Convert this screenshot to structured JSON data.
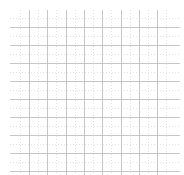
{
  "figure": {
    "title": "",
    "background_color": "#ffffff",
    "width": 184,
    "height": 175
  },
  "chart_data": {
    "type": "table",
    "title": "",
    "subtitle": "",
    "xlabel": "",
    "ylabel": "",
    "grid": true,
    "legend": "none",
    "categories": [],
    "values": [],
    "series": [],
    "xlim": [
      0,
      184
    ],
    "ylim": [
      0,
      175
    ],
    "major_grid": {
      "color": "#bdbdbd",
      "line_width": 1,
      "style": "solid",
      "horizontal_positions": [
        27,
        45,
        63,
        81,
        99,
        117,
        135,
        153,
        171
      ],
      "vertical_positions": [
        29,
        47.3,
        65.6,
        83.9,
        102.2,
        120.5,
        138.8,
        157.1
      ],
      "horizontal_spacing": 18,
      "vertical_spacing": 18.3,
      "horizontal_count": 9,
      "vertical_count": 8
    },
    "minor_grid": {
      "color": "#e2e2e2",
      "line_width": 1,
      "style": "dotted",
      "dash_pattern": "1px on, 2px off",
      "spacing": 9.15,
      "horizontal_positions": [
        18,
        36,
        54,
        72,
        90,
        108,
        126,
        144,
        162
      ],
      "vertical_positions": [
        19.8,
        38.1,
        56.4,
        74.7,
        93,
        111.3,
        129.6,
        147.9,
        166.2
      ]
    },
    "extent": {
      "left": 10,
      "right": 180,
      "top": 10,
      "bottom": 175
    }
  }
}
